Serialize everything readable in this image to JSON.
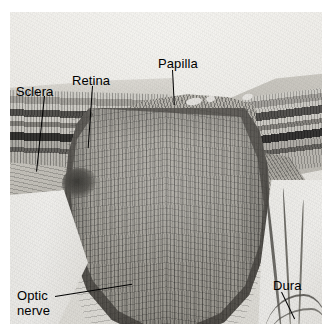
{
  "figure": {
    "kind": "histology-micrograph",
    "modality": "light microscopy, grayscale",
    "plate": {
      "x": 10,
      "y": 12,
      "width": 312,
      "height": 312,
      "background_color": "#ffffff",
      "tissue_mid_gray": "#a7a49c",
      "dark_band_color": "#161513",
      "light_space_color": "#f4f3ef"
    }
  },
  "labels": [
    {
      "id": "sclera",
      "text": "Sclera",
      "name": "label-sclera",
      "x": 16,
      "y": 84,
      "leader": {
        "type": "line",
        "from": [
          44,
          96
        ],
        "to": [
          52,
          172
        ],
        "angle_deg": 6
      }
    },
    {
      "id": "retina",
      "text": "Retina",
      "name": "label-retina",
      "x": 72,
      "y": 73,
      "leader": {
        "type": "line",
        "from": [
          92,
          86
        ],
        "to": [
          96,
          148
        ],
        "angle_deg": 4
      }
    },
    {
      "id": "papilla",
      "text": "Papilla",
      "name": "label-papilla",
      "x": 158,
      "y": 56,
      "leader": {
        "type": "line",
        "from": [
          172,
          70
        ],
        "to": [
          170,
          105
        ],
        "angle_deg": -3
      }
    },
    {
      "id": "optic-nerve",
      "text": "Optic\nnerve",
      "name": "label-optic-nerve",
      "x": 17,
      "y": 288,
      "lines": [
        "Optic",
        "nerve"
      ],
      "leader": {
        "type": "line",
        "from": [
          55,
          296
        ],
        "to": [
          133,
          284
        ],
        "angle_deg": -9
      }
    },
    {
      "id": "dura",
      "text": "Dura",
      "name": "label-dura",
      "x": 273,
      "y": 278,
      "leader": {
        "type": "line",
        "from": [
          281,
          292
        ],
        "to": [
          268,
          319
        ],
        "angle_deg": -26
      }
    }
  ],
  "structures": [
    {
      "id": "retina-left",
      "description": "Layered retina, left side, horizontal dark bands"
    },
    {
      "id": "retina-right",
      "description": "Layered retina, right side, curving downward"
    },
    {
      "id": "sclera-left",
      "description": "Fibrous sclera wedge beneath left retina"
    },
    {
      "id": "papilla",
      "description": "Optic disc surface with pale vessel lumina"
    },
    {
      "id": "optic-nerve",
      "description": "Bulbous, vertically striated nerve fiber bundle"
    },
    {
      "id": "dura",
      "description": "Thin dark dural strands in pale space, lower right"
    }
  ],
  "typography": {
    "label_font_size_px": 13,
    "label_color": "#000000"
  }
}
